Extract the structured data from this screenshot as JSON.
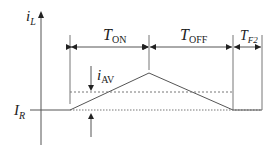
{
  "diagram": {
    "type": "inductor current waveform",
    "y_axis_label": {
      "main": "i",
      "sub": "L"
    },
    "reference_level_label": {
      "main": "I",
      "sub": "R"
    },
    "average_current_label": {
      "main": "i",
      "sub": "AV"
    },
    "intervals": [
      {
        "main": "T",
        "sub": "ON"
      },
      {
        "main": "T",
        "sub": "OFF"
      },
      {
        "main": "T",
        "sub": "F2"
      }
    ],
    "colors": {
      "line": "#555555",
      "text": "#222222",
      "background": "#ffffff"
    }
  }
}
